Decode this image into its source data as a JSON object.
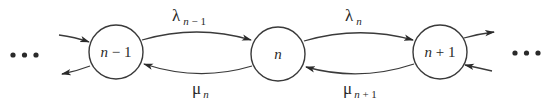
{
  "diagram": {
    "type": "birth-death-process-state-transition",
    "colors": {
      "stroke": "#3a3a3a",
      "text": "#2a2a2a",
      "background": "#ffffff"
    },
    "left_ellipsis": "•••",
    "right_ellipsis": "•••",
    "nodes": [
      {
        "id": "n-1",
        "var": "n",
        "op": " − ",
        "num": "1",
        "cx": 116,
        "cy": 52,
        "r": 27
      },
      {
        "id": "n",
        "var": "n",
        "op": "",
        "num": "",
        "cx": 278,
        "cy": 54,
        "r": 27
      },
      {
        "id": "n+1",
        "var": "n",
        "op": " + ",
        "num": "1",
        "cx": 440,
        "cy": 52,
        "r": 27
      }
    ],
    "edges": [
      {
        "from": "n-1",
        "to": "n",
        "direction": "forward",
        "symbol": "λ",
        "sub_var": "n",
        "sub_rest": " − 1"
      },
      {
        "from": "n",
        "to": "n-1",
        "direction": "backward",
        "symbol": "μ",
        "sub_var": "n",
        "sub_rest": ""
      },
      {
        "from": "n",
        "to": "n+1",
        "direction": "forward",
        "symbol": "λ",
        "sub_var": "n",
        "sub_rest": ""
      },
      {
        "from": "n+1",
        "to": "n",
        "direction": "backward",
        "symbol": "μ",
        "sub_var": "n",
        "sub_rest": " + 1"
      }
    ]
  }
}
